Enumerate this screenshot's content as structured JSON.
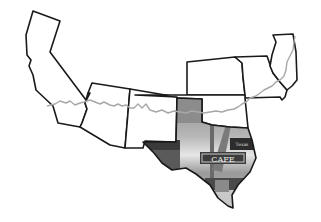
{
  "map": {
    "title": "Route 66 states map",
    "states": [
      {
        "id": "CA",
        "name": "California",
        "fill": "#ffffff"
      },
      {
        "id": "AZ",
        "name": "Arizona",
        "fill": "#ffffff"
      },
      {
        "id": "NM",
        "name": "New Mexico",
        "fill": "#ffffff"
      },
      {
        "id": "TX",
        "name": "Texas",
        "fill": "photo"
      },
      {
        "id": "OK",
        "name": "Oklahoma",
        "fill": "#ffffff"
      },
      {
        "id": "KS",
        "name": "Kansas",
        "fill": "#ffffff"
      },
      {
        "id": "MO",
        "name": "Missouri",
        "fill": "#ffffff"
      },
      {
        "id": "IL",
        "name": "Illinois",
        "fill": "#ffffff"
      }
    ],
    "route": {
      "name": "Route 66",
      "color": "#a8a8a8"
    },
    "photo": {
      "description": "Roadside cafe photo inside Texas",
      "sign_text": "CAFE",
      "small_sign_text": "Texas"
    },
    "colors": {
      "outline": "#1a1a1a",
      "panhandle": "#8c8c8c",
      "background": "#ffffff"
    }
  }
}
